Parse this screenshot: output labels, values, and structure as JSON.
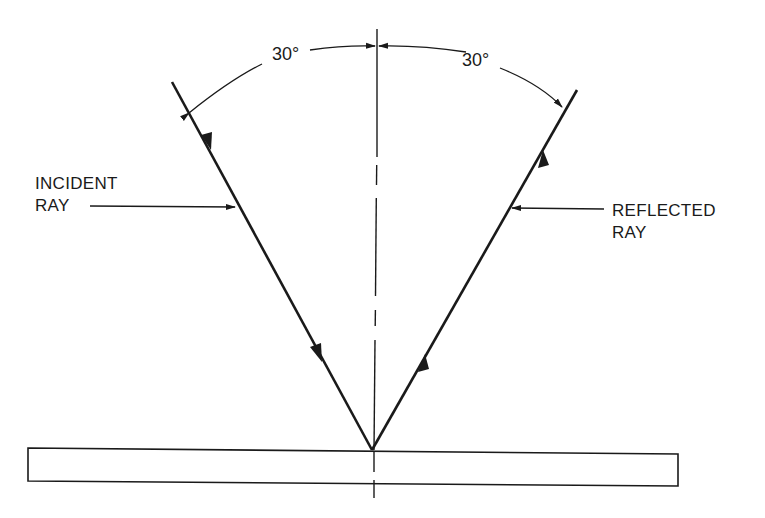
{
  "diagram": {
    "labels": {
      "incident_line1": "INCIDENT",
      "incident_line2": "RAY",
      "reflected_line1": "REFLECTED",
      "reflected_line2": "RAY",
      "angle_incidence": "30°",
      "angle_reflection": "30°"
    },
    "colors": {
      "ink": "#1a1a1a",
      "background": "#ffffff"
    }
  }
}
